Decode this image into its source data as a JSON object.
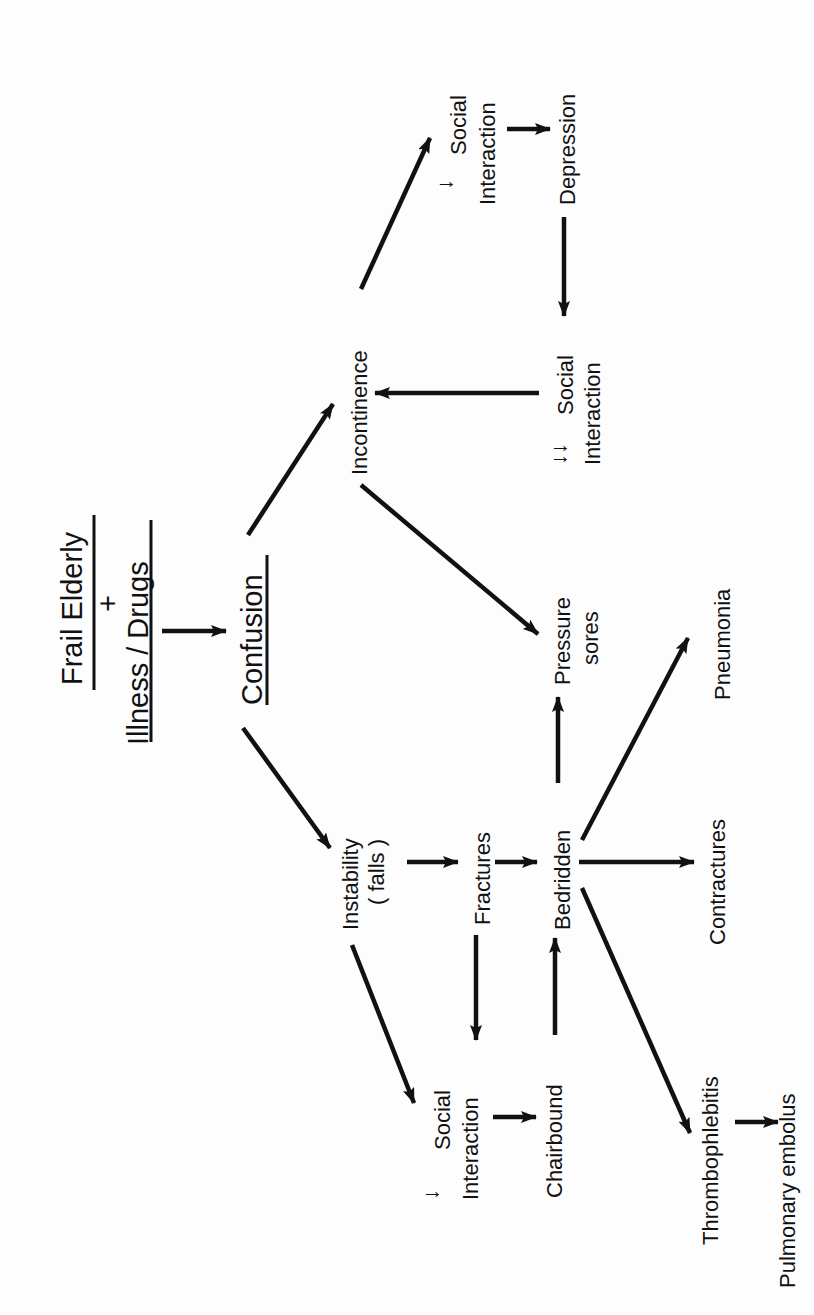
{
  "diagram": {
    "orientation": "rotated-90-ccw",
    "title": {
      "numerator": "Frail Elderly",
      "plus": "+",
      "denominator": "Illness / Drugs"
    },
    "nodes": {
      "confusion": "Confusion",
      "incontinence": "Incontinence",
      "dec_social_1": {
        "prefix": "↓",
        "line1": "Social",
        "line2": "Interaction"
      },
      "depression": "Depression",
      "dec_social_2": {
        "prefix": "↓↓",
        "line1": "Social",
        "line2": "Interaction"
      },
      "pressure_sores": {
        "line1": "Pressure",
        "line2": "sores"
      },
      "pneumonia": "Pneumonia",
      "instability": {
        "line1": "Instability",
        "line2": "( falls )"
      },
      "fractures": "Fractures",
      "bedridden": "Bedridden",
      "contractures": "Contractures",
      "dec_social_3": {
        "prefix": "↓",
        "line1": "Social",
        "line2": "Interaction"
      },
      "chairbound": "Chairbound",
      "thrombophlebitis": "Thrombophlebitis",
      "pulmonary_embolus": "Pulmonary embolus"
    },
    "edges": [
      {
        "from": "Frail Elderly + Illness / Drugs",
        "to": "Confusion"
      },
      {
        "from": "Confusion",
        "to": "Incontinence"
      },
      {
        "from": "Confusion",
        "to": "Instability (falls)"
      },
      {
        "from": "Incontinence",
        "to": "↓ Social Interaction"
      },
      {
        "from": "↓ Social Interaction",
        "to": "Depression"
      },
      {
        "from": "Depression",
        "to": "↓↓ Social Interaction"
      },
      {
        "from": "↓↓ Social Interaction",
        "to": "Incontinence"
      },
      {
        "from": "Incontinence",
        "to": "Pressure sores"
      },
      {
        "from": "Instability (falls)",
        "to": "Fractures"
      },
      {
        "from": "Instability (falls)",
        "to": "↓ Social Interaction"
      },
      {
        "from": "Fractures",
        "to": "Bedridden"
      },
      {
        "from": "Fractures",
        "to": "↓ Social Interaction"
      },
      {
        "from": "↓ Social Interaction",
        "to": "Chairbound"
      },
      {
        "from": "Chairbound",
        "to": "Bedridden"
      },
      {
        "from": "Bedridden",
        "to": "Pressure sores"
      },
      {
        "from": "Bedridden",
        "to": "Pneumonia"
      },
      {
        "from": "Bedridden",
        "to": "Contractures"
      },
      {
        "from": "Bedridden",
        "to": "Thrombophlebitis"
      },
      {
        "from": "Thrombophlebitis",
        "to": "Pulmonary embolus"
      }
    ]
  }
}
